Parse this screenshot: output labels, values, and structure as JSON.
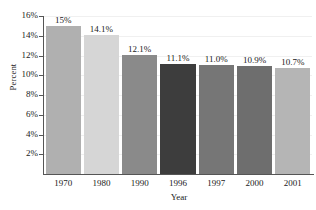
{
  "chart_data": {
    "type": "bar",
    "title": "",
    "xlabel": "Year",
    "ylabel": "Percent",
    "categories": [
      "1970",
      "1980",
      "1990",
      "1996",
      "1997",
      "2000",
      "2001"
    ],
    "values": [
      15.0,
      14.1,
      12.1,
      11.1,
      11.0,
      10.9,
      10.7
    ],
    "data_labels": [
      "15%",
      "14.1%",
      "12.1%",
      "11.1%",
      "11.0%",
      "10.9%",
      "10.7%"
    ],
    "ylim": [
      0,
      16
    ],
    "ytick_values": [
      16,
      14,
      12,
      10,
      8,
      6,
      4,
      2
    ],
    "ytick_labels": [
      "16%",
      "14%",
      "12%",
      "10%",
      "8%",
      "6%",
      "4%",
      "2%"
    ],
    "grid": true,
    "legend": "none",
    "bar_colors": [
      "#b0b0b0",
      "#d6d6d6",
      "#8a8a8a",
      "#3d3d3d",
      "#767676",
      "#6e6e6e",
      "#b5b5b5"
    ],
    "axis_color": "#555555",
    "grid_color": "#f0f0f0",
    "text_color": "#1a1a1a"
  }
}
